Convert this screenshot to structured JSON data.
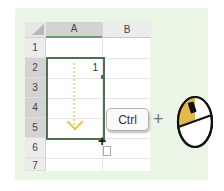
{
  "spreadsheet": {
    "columns": [
      "A",
      "B"
    ],
    "rows": [
      "1",
      "2",
      "3",
      "4",
      "5",
      "6",
      "7"
    ],
    "selected_range": "A2:A5",
    "cells": {
      "A2": "1"
    }
  },
  "instruction": {
    "key_label": "Ctrl",
    "combiner": "+",
    "mouse_action": "left-click-drag"
  },
  "colors": {
    "background_panel": "#eaf5e6",
    "selection_border": "#4f6f52",
    "drag_arrow": "#e8c45a",
    "mouse_button_highlight": "#e2b94a"
  },
  "icons": {
    "fill_cursor": "+",
    "paste_options": "clipboard-icon",
    "drag_direction": "arrow-down-icon",
    "mouse": "mouse-icon"
  }
}
